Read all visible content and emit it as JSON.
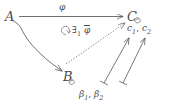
{
  "diagram": {
    "type": "commutative-diagram",
    "background_color": "#ffffff",
    "ink_color": "#4a4a4a",
    "objects": [
      {
        "id": "A",
        "label": "A",
        "x": 5,
        "y": 10,
        "decoration": "none"
      },
      {
        "id": "B",
        "label": "B",
        "x": 63,
        "y": 70,
        "decoration": "loop"
      },
      {
        "id": "C",
        "label": "C",
        "x": 127,
        "y": 10,
        "decoration": "loop"
      }
    ],
    "arrow_labels": {
      "phi": "φ",
      "exists_quantifier": "∃",
      "exists_subscript": "1",
      "exists_map": "φ",
      "constants": "c",
      "constant_sub_1": "1",
      "constant_sub_2": "2",
      "beta": "β",
      "beta_sub_1": "1",
      "beta_sub_2": "2",
      "comma": ",",
      "commutes_symbol": "↻"
    },
    "labels_plain": {
      "top_arrow": "φ",
      "diagonal_arrow": "∃₁ φ̄",
      "right_arrows": "c₁, c₂",
      "bottom_arrows": "β₁, β₂"
    },
    "arrows": [
      {
        "name": "A-to-C",
        "from": "A",
        "to": "C",
        "style": "solid",
        "label": "φ"
      },
      {
        "name": "A-to-B",
        "from": "A",
        "to": "B",
        "style": "solid-curved",
        "label": ""
      },
      {
        "name": "B-to-C",
        "from": "B",
        "to": "C",
        "style": "dashed",
        "label": "∃₁ φ̄"
      },
      {
        "name": "beta1-to-C",
        "from": "β₁",
        "to": "C",
        "style": "mapsto",
        "label": "c₁"
      },
      {
        "name": "beta2-to-C",
        "from": "β₂",
        "to": "C",
        "style": "mapsto",
        "label": "c₂"
      }
    ]
  }
}
